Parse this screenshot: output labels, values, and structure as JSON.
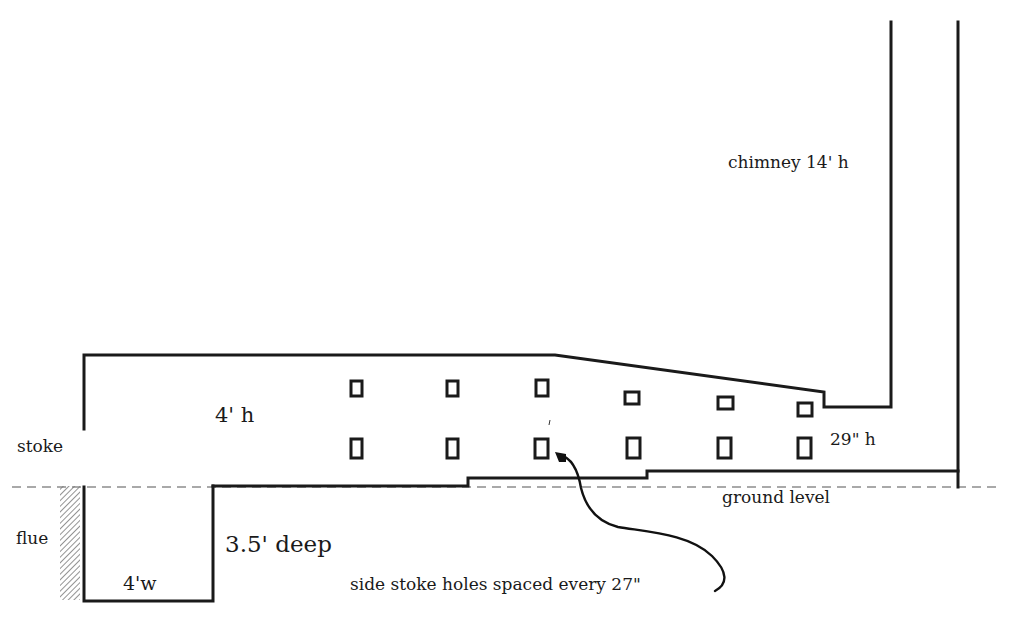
{
  "labels": {
    "chimney": "chimney 14' h",
    "kiln_height": "4' h",
    "stoke": "stoke",
    "exit_height": "29\" h",
    "ground": "ground level",
    "flue": "flue",
    "pit_depth": "3.5' deep",
    "pit_width": "4'w",
    "annotation": "side stoke holes spaced every 27\""
  },
  "stoke_holes": {
    "columns": 6,
    "rows": 2,
    "spacing_inches": 27
  },
  "colors": {
    "ink": "#1a1a1a",
    "ground_line": "#555555",
    "background": "#ffffff"
  }
}
